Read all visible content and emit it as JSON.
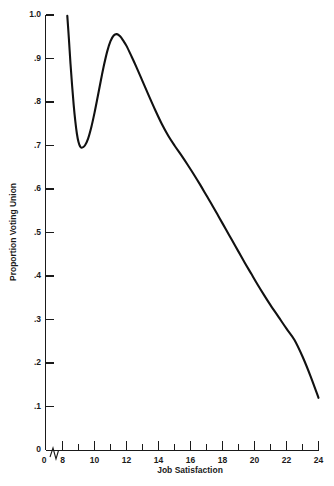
{
  "chart_data": {
    "type": "line",
    "title": "",
    "xlabel": "Job Satisfaction",
    "ylabel": "Proportion Voting Union",
    "xlim": [
      8,
      24
    ],
    "ylim": [
      0,
      1.0
    ],
    "grid": false,
    "legend": "none",
    "axis_break_x": true,
    "x_origin_label": "0",
    "x_ticks_major": [
      8,
      10,
      12,
      14,
      16,
      18,
      20,
      22,
      24
    ],
    "x_tick_labels": [
      "8",
      "10",
      "12",
      "14",
      "16",
      "18",
      "20",
      "22",
      "24"
    ],
    "x_ticks_minor": [
      9,
      11,
      13,
      15,
      17,
      19,
      21,
      23
    ],
    "y_ticks_major": [
      0,
      0.1,
      0.2,
      0.3,
      0.4,
      0.5,
      0.6,
      0.7,
      0.8,
      0.9,
      1.0
    ],
    "y_tick_labels": [
      "0",
      ".1",
      ".2",
      ".3",
      ".4",
      ".5",
      ".6",
      ".7",
      ".8",
      ".9",
      "1.0"
    ],
    "series": [
      {
        "name": "Proportion Voting Union",
        "color": "#111111",
        "x": [
          8.3,
          8.4,
          8.5,
          8.6,
          8.7,
          8.8,
          8.9,
          9.0,
          9.1,
          9.2,
          9.4,
          9.6,
          9.8,
          10.0,
          10.2,
          10.4,
          10.6,
          10.8,
          11.0,
          11.2,
          11.4,
          11.6,
          11.8,
          12.0,
          12.3,
          12.6,
          13.0,
          13.4,
          13.8,
          14.2,
          14.6,
          15.0,
          15.4,
          15.8,
          16.2,
          16.6,
          17.0,
          17.4,
          17.8,
          18.2,
          18.6,
          19.0,
          19.4,
          19.8,
          20.2,
          20.6,
          21.0,
          21.5,
          22.0,
          22.5,
          23.0,
          23.5,
          24.0
        ],
        "y": [
          0.998,
          0.945,
          0.888,
          0.838,
          0.793,
          0.756,
          0.727,
          0.708,
          0.698,
          0.695,
          0.7,
          0.716,
          0.742,
          0.775,
          0.812,
          0.85,
          0.886,
          0.917,
          0.94,
          0.953,
          0.956,
          0.951,
          0.941,
          0.929,
          0.906,
          0.882,
          0.848,
          0.814,
          0.781,
          0.75,
          0.723,
          0.7,
          0.679,
          0.657,
          0.634,
          0.61,
          0.585,
          0.56,
          0.534,
          0.508,
          0.482,
          0.456,
          0.43,
          0.405,
          0.38,
          0.356,
          0.333,
          0.306,
          0.279,
          0.253,
          0.215,
          0.17,
          0.12
        ]
      }
    ],
    "annotations": {
      "local_minimum": {
        "x": 9.2,
        "y": 0.695
      },
      "local_maximum": {
        "x": 11.4,
        "y": 0.956
      },
      "curve_start": {
        "x": 8.3,
        "y": 1.0
      },
      "curve_end": {
        "x": 24.0,
        "y": 0.12
      }
    }
  },
  "axes": {
    "x_title": "Job Satisfaction",
    "y_title": "Proportion Voting Union",
    "origin_label": "0",
    "x_labels": [
      "8",
      "10",
      "12",
      "14",
      "16",
      "18",
      "20",
      "22",
      "24"
    ],
    "y_labels": [
      "0",
      ".1",
      ".2",
      ".3",
      ".4",
      ".5",
      ".6",
      ".7",
      ".8",
      ".9",
      "1.0"
    ]
  },
  "colors": {
    "background": "#ffffff",
    "axis": "#1a1a1a",
    "curve": "#111111"
  }
}
